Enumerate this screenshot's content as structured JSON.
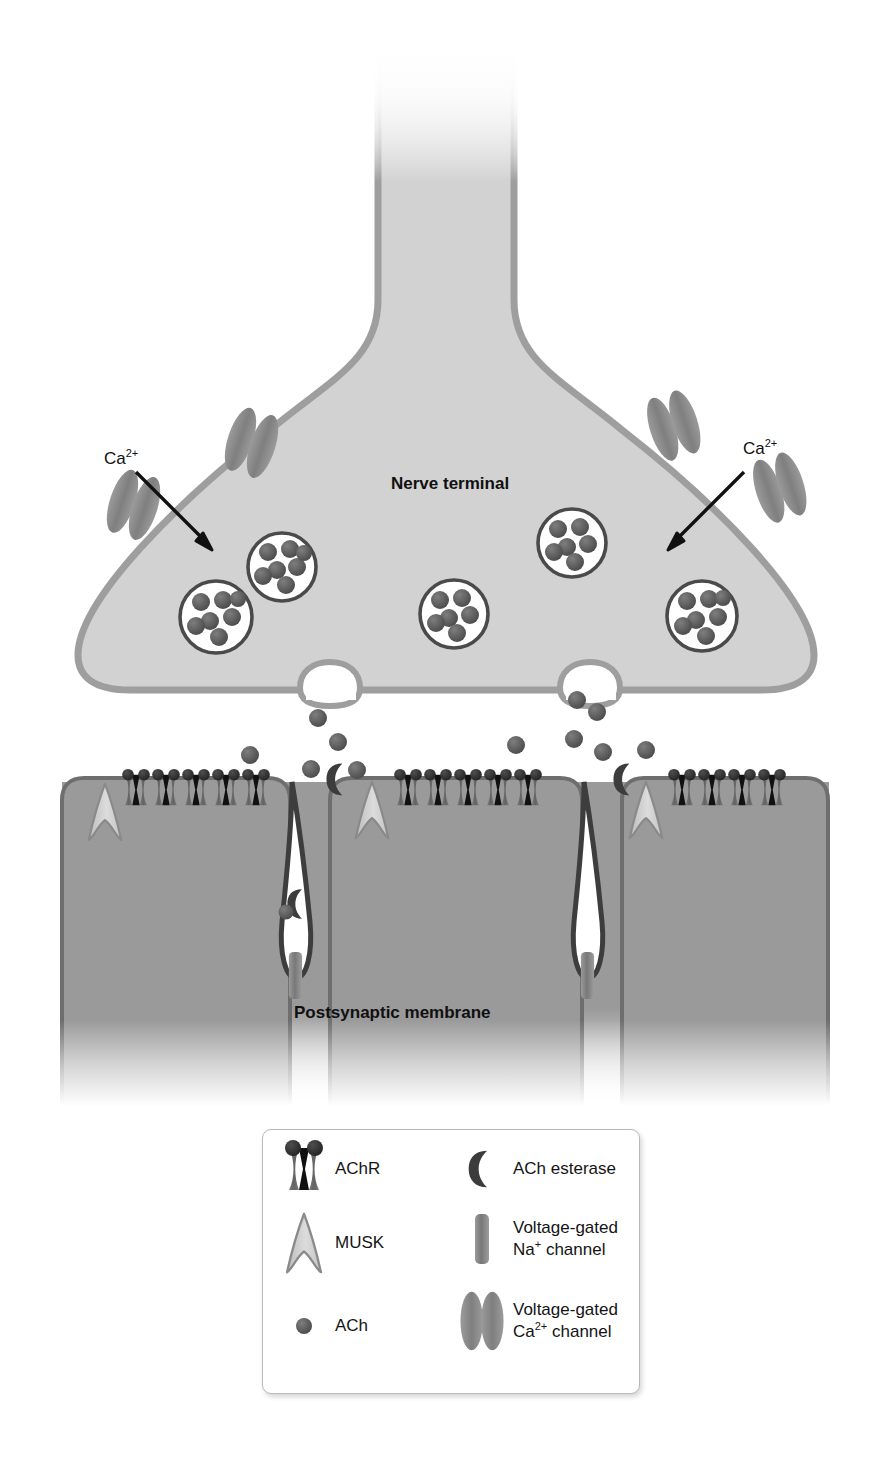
{
  "figure": {
    "type": "biological-diagram"
  },
  "labels": {
    "nerve_terminal": "Nerve terminal",
    "postsynaptic_membrane": "Postsynaptic membrane",
    "calcium_left": "Ca",
    "calcium_left_sup": "2+",
    "calcium_right": "Ca",
    "calcium_right_sup": "2+"
  },
  "legend": {
    "items": [
      {
        "key": "achr",
        "label": "AChR",
        "label2": "",
        "icon": "achr-icon"
      },
      {
        "key": "musk",
        "label": "MUSK",
        "label2": "",
        "icon": "musk-icon"
      },
      {
        "key": "ach",
        "label": "ACh",
        "label2": "",
        "icon": "ach-dot-icon"
      },
      {
        "key": "ache",
        "label": "ACh esterase",
        "label2": "",
        "icon": "ach-esterase-icon"
      },
      {
        "key": "nav",
        "label": "Voltage-gated",
        "label2": "Na",
        "label2_sup": "+",
        "label2_tail": " channel",
        "icon": "sodium-channel-icon"
      },
      {
        "key": "cav",
        "label": "Voltage-gated",
        "label2": "Ca",
        "label2_sup": "2+",
        "label2_tail": " channel",
        "icon": "calcium-channel-icon"
      }
    ]
  },
  "colors": {
    "terminal_fill": "#d2d2d2",
    "terminal_membrane": "#9e9e9e",
    "muscle_fill": "#9a9a9a",
    "muscle_outline": "#6e6e6e",
    "receptor_body": "#6d6d6d",
    "receptor_head": "#2f2f2f",
    "receptor_pore": "#111111",
    "vesicle_outline": "#4a4a4a",
    "ach_dot": "#585858",
    "ca_channel": "#8c8c8c",
    "musk_fill": "#c9c9c9",
    "musk_outline": "#8a8a8a",
    "esterase": "#3a3a3a",
    "sodium_channel": "#8a8a8a",
    "cleft": "#ffffff",
    "text": "#101010"
  },
  "structures": {
    "calcium_channels": 4,
    "synaptic_vesicles": 5,
    "fusion_pores": 2,
    "junctional_folds": 2,
    "receptor_clusters": 3,
    "musk_count": 3,
    "esterase_count": 2,
    "sodium_channels": 2
  }
}
